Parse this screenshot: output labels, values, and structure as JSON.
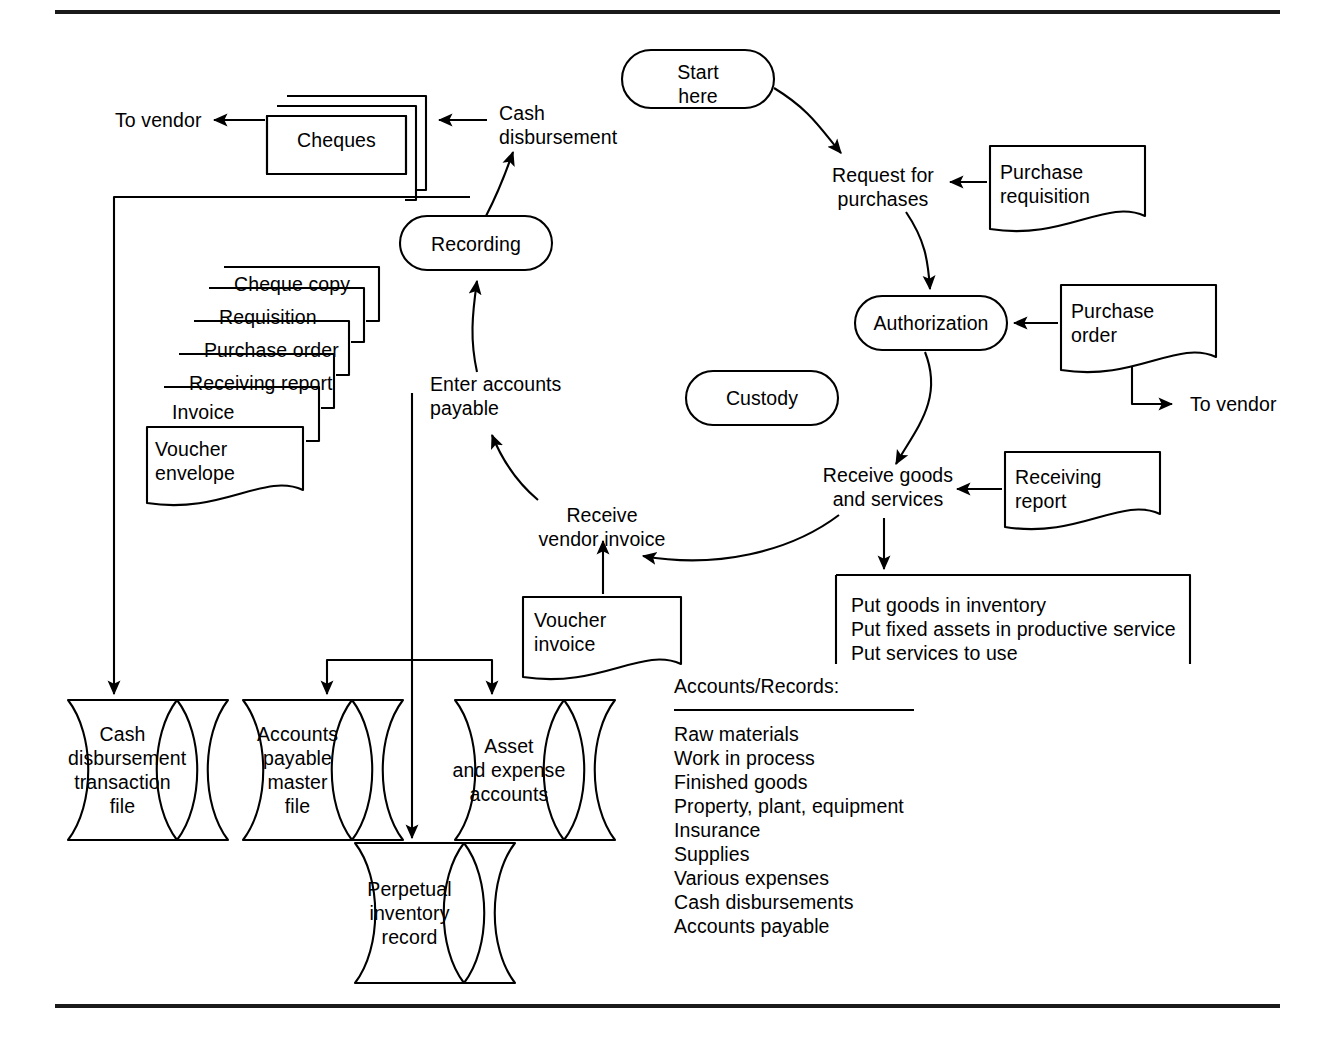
{
  "diagram": {
    "rules": {
      "top": "horizontal-rule",
      "bottom": "horizontal-rule"
    },
    "terminators": {
      "start_here": "Start\nhere",
      "recording": "Recording",
      "authorization": "Authorization",
      "custody": "Custody"
    },
    "process_labels": {
      "request_for_purchases": "Request for\npurchases",
      "receive_goods_and_services": "Receive goods\nand services",
      "receive_vendor_invoice": "Receive\nvendor invoice",
      "enter_accounts_payable": "Enter accounts\npayable",
      "cash_disbursement": "Cash\ndisbursement"
    },
    "connector_labels": {
      "to_vendor_left": "To vendor",
      "to_vendor_right": "To vendor"
    },
    "documents": {
      "purchase_requisition": "Purchase\nrequisition",
      "purchase_order": "Purchase\norder",
      "receiving_report": "Receiving\nreport",
      "voucher_invoice": "Voucher\ninvoice"
    },
    "multidoc_cheques": "Cheques",
    "voucher_packet": [
      "Cheque copy",
      "Requisition",
      "Purchase order",
      "Receiving report",
      "Invoice",
      "Voucher\nenvelope"
    ],
    "action_box": {
      "lines": [
        "Put goods in inventory",
        "Put fixed assets in productive service",
        "Put services to use"
      ]
    },
    "storage": {
      "cash_disbursement_transaction_file": "Cash\ndisbursement\ntransaction\nfile",
      "accounts_payable_master_file": "Accounts\npayable\nmaster\nfile",
      "asset_and_expense_accounts": "Asset\nand expense\naccounts",
      "perpetual_inventory_record": "Perpetual\ninventory\nrecord"
    },
    "accounts_records": {
      "heading": "Accounts/Records:",
      "items": [
        "Raw materials",
        "Work in process",
        "Finished goods",
        "Property, plant, equipment",
        "Insurance",
        "Supplies",
        "Various expenses",
        "Cash disbursements",
        "Accounts payable"
      ]
    },
    "colors": {
      "ink": "#000000",
      "rule": "#1a1a1a",
      "background": "#ffffff"
    }
  }
}
